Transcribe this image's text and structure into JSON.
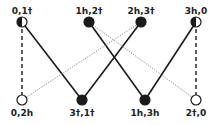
{
  "diagram": {
    "colors": {
      "ink": "#1a1a1a",
      "dotted": "#888888",
      "background": "#ffffff"
    },
    "nodes": [
      {
        "id": "n01t",
        "label": "0,1†",
        "x": 22,
        "y": 22,
        "fill": "half"
      },
      {
        "id": "n1h2t",
        "label": "1h,2†",
        "x": 89,
        "y": 22,
        "fill": "full"
      },
      {
        "id": "n2h3t",
        "label": "2h,3†",
        "x": 141,
        "y": 22,
        "fill": "full"
      },
      {
        "id": "n3h0",
        "label": "3h,0",
        "x": 196,
        "y": 22,
        "fill": "half"
      },
      {
        "id": "n02h",
        "label": "0,2h",
        "x": 22,
        "y": 100,
        "fill": "open"
      },
      {
        "id": "n3t1t",
        "label": "3†,1†",
        "x": 82,
        "y": 100,
        "fill": "full"
      },
      {
        "id": "n1h3h",
        "label": "1h,3h",
        "x": 145,
        "y": 100,
        "fill": "full"
      },
      {
        "id": "n2t0",
        "label": "2†,0",
        "x": 196,
        "y": 100,
        "fill": "open"
      }
    ],
    "edges": [
      {
        "from": "n01t",
        "to": "n3t1t",
        "style": "solid"
      },
      {
        "from": "n2h3t",
        "to": "n3t1t",
        "style": "solid"
      },
      {
        "from": "n1h2t",
        "to": "n1h3h",
        "style": "solid"
      },
      {
        "from": "n3h0",
        "to": "n1h3h",
        "style": "solid"
      },
      {
        "from": "n02h",
        "to": "n2h3t",
        "style": "dotted"
      },
      {
        "from": "n1h2t",
        "to": "n2t0",
        "style": "dotted"
      },
      {
        "from": "n01t",
        "to": "n02h",
        "style": "dashed"
      },
      {
        "from": "n3h0",
        "to": "n2t0",
        "style": "dashed"
      }
    ]
  }
}
